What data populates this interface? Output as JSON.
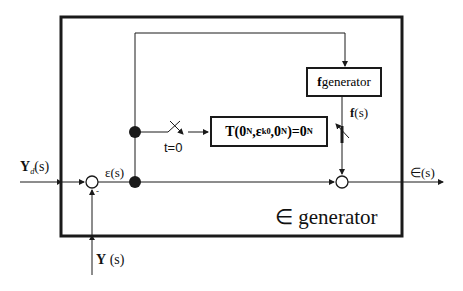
{
  "diagram": {
    "outer_block": {
      "label_symbol": "∈",
      "label_text": "generator"
    },
    "f_generator": {
      "label_bold": "f",
      "label_text": " generator"
    },
    "t_block": {
      "label_prefix": "T(",
      "zero1": "0",
      "sub1": "N",
      "eps": "ε",
      "eps_sup": "k",
      "eps_sub": "0",
      "zero2": "0",
      "sub2": "N",
      "close_eq": ")=",
      "zero3": "0",
      "sub3": "N"
    },
    "switch_label": "t=0",
    "signals": {
      "input_bold": "Y",
      "input_sub": "d",
      "input_arg": "(s)",
      "feedback_bold": "Y",
      "feedback_arg": " (s)",
      "error": "ε(s)",
      "f_bold": "f",
      "f_arg": "(s)",
      "output": "∈(s)",
      "minus_sign": "-"
    }
  }
}
